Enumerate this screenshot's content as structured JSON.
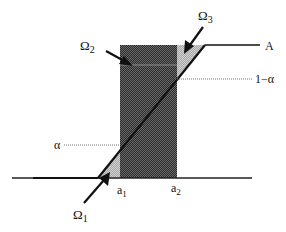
{
  "diagram": {
    "labels": {
      "omega1": "Ω",
      "omega1_sub": "1",
      "omega2": "Ω",
      "omega2_sub": "2",
      "omega3": "Ω",
      "omega3_sub": "3",
      "A": "A",
      "one_minus_alpha": "1−α",
      "alpha": "α",
      "a1": "a",
      "a1_sub": "1",
      "a2": "a",
      "a2_sub": "2"
    },
    "colors": {
      "dark_region": "#3a3a3a",
      "light_region": "#b8b8b8",
      "line": "#111111",
      "dotted": "#777777"
    },
    "regions": [
      {
        "name": "Ω1",
        "description": "light triangle between ramp and a1 near baseline"
      },
      {
        "name": "Ω2",
        "description": "dark rectangle between a1 and a2"
      },
      {
        "name": "Ω3",
        "description": "light triangle between a2 and ramp near level A"
      }
    ],
    "levels": [
      "α",
      "1−α",
      "A"
    ],
    "positions": [
      "a1",
      "a2"
    ]
  }
}
